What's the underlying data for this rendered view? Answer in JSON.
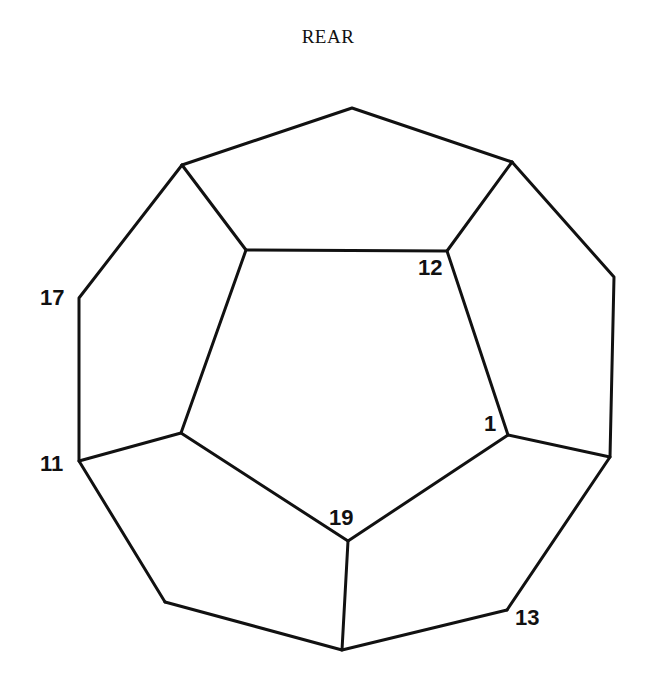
{
  "title": "REAR",
  "colors": {
    "line": "#111111",
    "background": "#ffffff"
  },
  "labels": {
    "v17": "17",
    "v11": "11",
    "v12": "12",
    "v1": "1",
    "v19": "19",
    "v13": "13"
  },
  "diagram": {
    "type": "dodecahedron-schlegel-view",
    "vertices": {
      "top": [
        352,
        108
      ],
      "ul": [
        182,
        165
      ],
      "ur": [
        512,
        162
      ],
      "i1": [
        246,
        250
      ],
      "i2": [
        447,
        251
      ],
      "i3": [
        508,
        435
      ],
      "i4": [
        348,
        541
      ],
      "i5": [
        181,
        433
      ],
      "l1": [
        79,
        298
      ],
      "l2": [
        79,
        461
      ],
      "r1": [
        614,
        277
      ],
      "r2": [
        610,
        457
      ],
      "b1": [
        165,
        602
      ],
      "b2": [
        342,
        650
      ],
      "b3": [
        507,
        610
      ]
    }
  }
}
